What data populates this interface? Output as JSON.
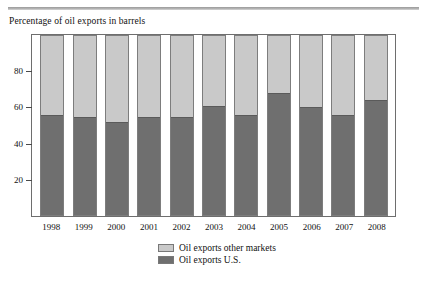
{
  "caption": "Percentage of oil exports in barrels",
  "colors": {
    "us": "#6f6f6f",
    "other_markets": "#c9c9c9",
    "frame": "#6e6e6e",
    "rule": "#9a9a9a"
  },
  "legend": {
    "items": [
      {
        "label": "Oil exports other markets",
        "swatch": "other_markets"
      },
      {
        "label": "Oil exports U.S.",
        "swatch": "us"
      }
    ]
  },
  "chart_data": {
    "type": "bar",
    "stacked": true,
    "title": "Percentage of oil exports in barrels",
    "xlabel": "",
    "ylabel": "",
    "ylim": [
      0,
      100
    ],
    "yticks": [
      20,
      40,
      60,
      80
    ],
    "ytick_labels": [
      "20",
      "40",
      "60",
      "80"
    ],
    "grid": false,
    "legend_position": "bottom-center",
    "categories": [
      "1998",
      "1999",
      "2000",
      "2001",
      "2002",
      "2003",
      "2004",
      "2005",
      "2006",
      "2007",
      "2008"
    ],
    "series": [
      {
        "name": "Oil exports U.S.",
        "color": "#6f6f6f",
        "values": [
          56,
          54.5,
          52,
          54.5,
          55,
          61,
          56,
          68,
          60.5,
          56,
          64
        ]
      },
      {
        "name": "Oil exports other markets",
        "color": "#c9c9c9",
        "values": [
          44,
          45.5,
          48,
          45.5,
          45,
          39,
          44,
          32,
          39.5,
          44,
          36
        ]
      }
    ]
  }
}
